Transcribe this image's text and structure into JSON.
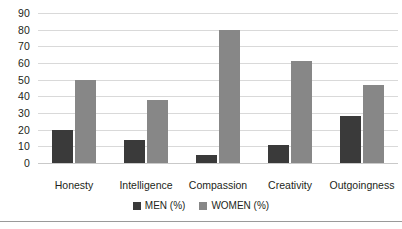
{
  "chart_data": {
    "type": "bar",
    "title": "",
    "subtitle": "",
    "xlabel": "",
    "ylabel": "",
    "ylim": [
      0,
      90
    ],
    "ytick_step": 10,
    "yticks": [
      0,
      10,
      20,
      30,
      40,
      50,
      60,
      70,
      80,
      90
    ],
    "grid": true,
    "grid_axis": "y",
    "legend_position": "bottom",
    "categories": [
      "Honesty",
      "Intelligence",
      "Compassion",
      "Creativity",
      "Outgoingness"
    ],
    "series": [
      {
        "name": "MEN (%)",
        "color": "#3a3a3a",
        "values": [
          20,
          14,
          5,
          11,
          28
        ]
      },
      {
        "name": "WOMEN (%)",
        "color": "#878787",
        "values": [
          50,
          38,
          80,
          61,
          47
        ]
      }
    ]
  },
  "style": {
    "gridline_color": "#d9d9d9",
    "baseline_color": "#c9c9c9",
    "bottom_rule_color": "#9a9a9a",
    "background": "#ffffff",
    "text_color": "#231f20"
  }
}
